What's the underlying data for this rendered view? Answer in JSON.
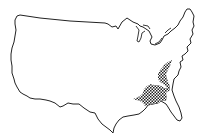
{
  "map": {
    "subject": "Contiguous United States outline",
    "highlighted_region": "Southeastern United States (crosshatched)",
    "colors": {
      "background": "#ffffff",
      "outline": "#222222",
      "hatch": "#222222"
    }
  }
}
